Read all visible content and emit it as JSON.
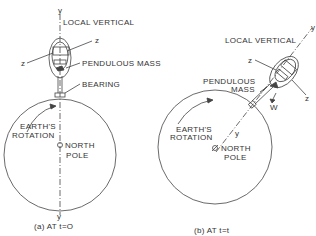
{
  "diagram": {
    "colors": {
      "line": "#444444",
      "text": "#333333",
      "background": "#ffffff"
    },
    "panel_a": {
      "caption": "(a) AT t=O",
      "labels": {
        "y_top": "y",
        "y_bottom": "y",
        "local_vertical": "LOCAL VERTICAL",
        "z_right": "z",
        "z_left": "z",
        "pendulous_mass": "PENDULOUS MASS",
        "bearing": "BEARING",
        "earths_rotation_1": "EARTH'S",
        "earths_rotation_2": "ROTATION",
        "north_pole_1": "NORTH",
        "north_pole_2": "POLE"
      }
    },
    "panel_b": {
      "caption": "(b) AT t=t",
      "labels": {
        "y_top": "y",
        "y_axis": "y",
        "local_vertical": "LOCAL VERTICAL",
        "z_left": "z",
        "z_right": "z",
        "pendulous_mass_1": "PENDULOUS",
        "pendulous_mass_2": "MASS",
        "w": "W",
        "earths_rotation_1": "EARTH'S",
        "earths_rotation_2": "ROTATION",
        "north_pole_1": "NORTH",
        "north_pole_2": "POLE"
      }
    }
  }
}
